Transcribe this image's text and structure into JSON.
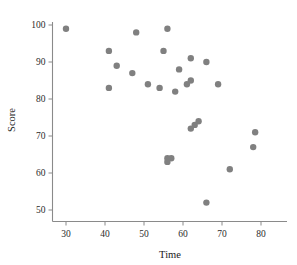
{
  "chart_data": {
    "type": "scatter",
    "title": "",
    "xlabel": "Time",
    "ylabel": "Score",
    "xlim": [
      24,
      86
    ],
    "ylim": [
      46,
      103
    ],
    "xticks": [
      30,
      40,
      50,
      60,
      70,
      80
    ],
    "yticks": [
      50,
      60,
      70,
      80,
      90,
      100
    ],
    "xtick_labels": [
      "30",
      "40",
      "50",
      "60",
      "70",
      "80"
    ],
    "ytick_labels": [
      "50",
      "60",
      "70",
      "80",
      "90",
      "100"
    ],
    "grid": false,
    "legend": null,
    "marker": {
      "shape": "circle",
      "color": "#808080",
      "size": 3.2
    },
    "x": [
      30,
      41,
      41,
      43,
      47,
      48,
      51,
      54,
      55,
      56,
      56,
      56,
      57,
      58,
      59,
      61,
      62,
      62,
      62,
      63,
      64,
      66,
      66,
      69,
      72,
      78,
      78.5
    ],
    "y": [
      99,
      93,
      83,
      89,
      87,
      98,
      84,
      83,
      93,
      99,
      63,
      64,
      64,
      82,
      88,
      84,
      85,
      91,
      72,
      73,
      74,
      90,
      52,
      84,
      61,
      67,
      71
    ],
    "points": [
      {
        "x": 30,
        "y": 99
      },
      {
        "x": 41,
        "y": 93
      },
      {
        "x": 41,
        "y": 83
      },
      {
        "x": 43,
        "y": 89
      },
      {
        "x": 47,
        "y": 87
      },
      {
        "x": 48,
        "y": 98
      },
      {
        "x": 51,
        "y": 84
      },
      {
        "x": 54,
        "y": 83
      },
      {
        "x": 55,
        "y": 93
      },
      {
        "x": 56,
        "y": 99
      },
      {
        "x": 56,
        "y": 63
      },
      {
        "x": 56,
        "y": 64
      },
      {
        "x": 57,
        "y": 64
      },
      {
        "x": 58,
        "y": 82
      },
      {
        "x": 59,
        "y": 88
      },
      {
        "x": 61,
        "y": 84
      },
      {
        "x": 62,
        "y": 85
      },
      {
        "x": 62,
        "y": 91
      },
      {
        "x": 62,
        "y": 72
      },
      {
        "x": 63,
        "y": 73
      },
      {
        "x": 64,
        "y": 74
      },
      {
        "x": 66,
        "y": 90
      },
      {
        "x": 66,
        "y": 52
      },
      {
        "x": 69,
        "y": 84
      },
      {
        "x": 72,
        "y": 61
      },
      {
        "x": 78,
        "y": 67
      },
      {
        "x": 78.5,
        "y": 71
      }
    ],
    "n_points": 27,
    "colors": {
      "marker": "#808080",
      "axis": "#8a8a8a",
      "text": "#1a1a1a",
      "background": "#ffffff"
    }
  }
}
